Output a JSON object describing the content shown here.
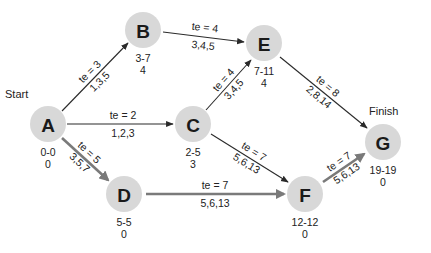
{
  "diagram": {
    "type": "PERT network",
    "start_label": "Start",
    "finish_label": "Finish",
    "colors": {
      "node_fill": "#d8d8d8",
      "normal_edge": "#2a2a2a",
      "critical_edge": "#7a7a7a",
      "text": "#222222"
    },
    "nodes": [
      {
        "id": "A",
        "label": "A",
        "times": "0-0",
        "slack": "0"
      },
      {
        "id": "B",
        "label": "B",
        "times": "3-7",
        "slack": "4"
      },
      {
        "id": "C",
        "label": "C",
        "times": "2-5",
        "slack": "3"
      },
      {
        "id": "D",
        "label": "D",
        "times": "5-5",
        "slack": "0"
      },
      {
        "id": "E",
        "label": "E",
        "times": "7-11",
        "slack": "4"
      },
      {
        "id": "F",
        "label": "F",
        "times": "12-12",
        "slack": "0"
      },
      {
        "id": "G",
        "label": "G",
        "times": "19-19",
        "slack": "0"
      }
    ],
    "edges": [
      {
        "from": "A",
        "to": "B",
        "te": "te = 3",
        "estimates": "1,3,5",
        "critical": false
      },
      {
        "from": "A",
        "to": "C",
        "te": "te = 2",
        "estimates": "1,2,3",
        "critical": false
      },
      {
        "from": "A",
        "to": "D",
        "te": "te = 5",
        "estimates": "3,5,7",
        "critical": true
      },
      {
        "from": "B",
        "to": "E",
        "te": "te = 4",
        "estimates": "3,4,5",
        "critical": false
      },
      {
        "from": "C",
        "to": "E",
        "te": "te = 4",
        "estimates": "3,4,5",
        "critical": false
      },
      {
        "from": "C",
        "to": "F",
        "te": "te = 7",
        "estimates": "5,6,13",
        "critical": false
      },
      {
        "from": "D",
        "to": "F",
        "te": "te = 7",
        "estimates": "5,6,13",
        "critical": true
      },
      {
        "from": "E",
        "to": "G",
        "te": "te = 8",
        "estimates": "2,8,14",
        "critical": false
      },
      {
        "from": "F",
        "to": "G",
        "te": "te = 7",
        "estimates": "5,6,13",
        "critical": true
      }
    ]
  }
}
